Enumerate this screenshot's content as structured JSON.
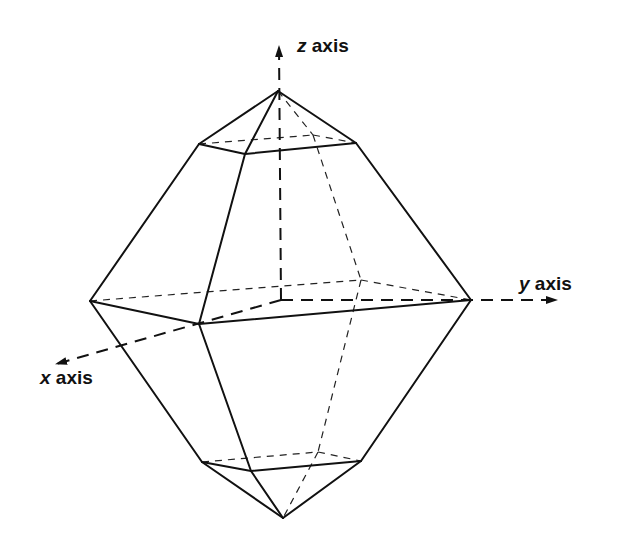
{
  "diagram": {
    "type": "crystal-form-3d",
    "colors": {
      "line": "#111111",
      "background": "#ffffff"
    },
    "labels": {
      "z": {
        "var": "z",
        "text": " axis"
      },
      "y": {
        "var": "y",
        "text": " axis"
      },
      "x": {
        "var": "x",
        "text": " axis"
      }
    },
    "vertices": {
      "top_apex": [
        278,
        91
      ],
      "upper_left": [
        199,
        144
      ],
      "upper_front": [
        245,
        154
      ],
      "upper_right": [
        356,
        143
      ],
      "upper_back": [
        313,
        135
      ],
      "mid_left": [
        90,
        301
      ],
      "mid_front": [
        199,
        324
      ],
      "mid_right": [
        471,
        300
      ],
      "mid_back": [
        361,
        280
      ],
      "lower_left": [
        202,
        462
      ],
      "lower_front": [
        251,
        471
      ],
      "lower_right": [
        361,
        461
      ],
      "lower_back": [
        318,
        452
      ],
      "bottom_apex": [
        283,
        518
      ],
      "origin": [
        281,
        300
      ]
    },
    "axes": {
      "z": {
        "from": [
          281,
          300
        ],
        "to": [
          279,
          45
        ]
      },
      "y": {
        "from": [
          281,
          300
        ],
        "to": [
          558,
          300
        ]
      },
      "x": {
        "from": [
          281,
          300
        ],
        "to": [
          55,
          364
        ]
      }
    }
  }
}
